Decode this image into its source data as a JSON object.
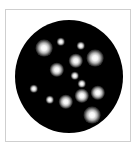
{
  "image": {
    "description": "Black circular field with scattered glowing white spots inside a thin grey square frame",
    "colors": {
      "background": "#ffffff",
      "frame_border": "#cfcfcf",
      "dish": "#000000",
      "spot_core": "#ffffff"
    },
    "dish": {
      "cx": 69,
      "cy": 76,
      "width": 108,
      "height": 113
    },
    "spots": [
      {
        "x": 44,
        "y": 48,
        "r": 7,
        "size": "large"
      },
      {
        "x": 61,
        "y": 42,
        "r": 3.5,
        "size": "small"
      },
      {
        "x": 81,
        "y": 46,
        "r": 3.5,
        "size": "small"
      },
      {
        "x": 95,
        "y": 58,
        "r": 7,
        "size": "large"
      },
      {
        "x": 76,
        "y": 61,
        "r": 6,
        "size": "medium"
      },
      {
        "x": 57,
        "y": 70,
        "r": 6,
        "size": "medium"
      },
      {
        "x": 75,
        "y": 76,
        "r": 3.5,
        "size": "small"
      },
      {
        "x": 82,
        "y": 84,
        "r": 3.5,
        "size": "small"
      },
      {
        "x": 34,
        "y": 89,
        "r": 3.5,
        "size": "small"
      },
      {
        "x": 98,
        "y": 93,
        "r": 6,
        "size": "medium"
      },
      {
        "x": 82,
        "y": 96,
        "r": 6,
        "size": "medium"
      },
      {
        "x": 50,
        "y": 100,
        "r": 3.5,
        "size": "small"
      },
      {
        "x": 66,
        "y": 102,
        "r": 6,
        "size": "medium"
      },
      {
        "x": 92,
        "y": 115,
        "r": 7,
        "size": "large"
      }
    ]
  }
}
